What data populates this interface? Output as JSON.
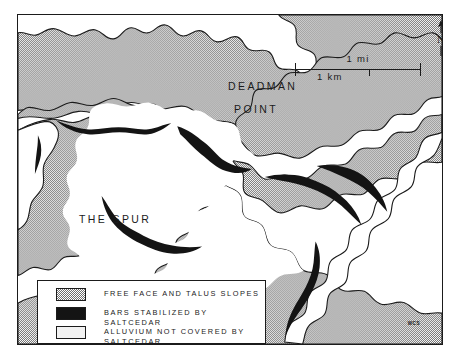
{
  "figure": {
    "type": "geomorphic-map",
    "credit": "WCS"
  },
  "scale_bar": {
    "label_miles": "1 mi",
    "label_kilometers": "1 km"
  },
  "north_arrow": {
    "label": "N"
  },
  "place_labels": [
    {
      "line1": "DEADMAN",
      "line2": "POINT"
    },
    {
      "line1": "THE SPUR"
    }
  ],
  "labels": {
    "deadman": "DEADMAN",
    "point": "POINT",
    "the_spur": "THE SPUR"
  },
  "legend": {
    "items": [
      {
        "swatch": "stipple-gray",
        "label": "FREE FACE AND TALUS SLOPES"
      },
      {
        "swatch": "solid-black",
        "label": "BARS STABILIZED BY SALTCEDAR"
      },
      {
        "swatch": "white-outline",
        "label": "ALLUVIUM NOT COVERED BY\n    SALTCEDAR"
      }
    ]
  },
  "colors": {
    "ink": "#1b1b1b",
    "stipple_gray": "#6f6f6f",
    "bar_black": "#141414",
    "alluvium_white": "#ffffff",
    "background": "#ffffff"
  }
}
